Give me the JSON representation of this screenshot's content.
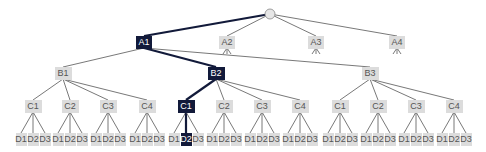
{
  "diagram": {
    "type": "tree",
    "colors": {
      "node_fill": "#dcdcdc",
      "node_text": "#555555",
      "active_fill": "#121a3a",
      "active_text": "#ffffff",
      "edge": "#555555",
      "active_edge": "#121a3a",
      "root_fill": "#e6e6e6"
    },
    "root": {
      "label": "",
      "x": 270,
      "y": 14
    },
    "level_a": [
      {
        "label": "A1",
        "x": 144,
        "y": 42,
        "active": true
      },
      {
        "label": "A2",
        "x": 227,
        "y": 42,
        "active": false
      },
      {
        "label": "A3",
        "x": 316,
        "y": 42,
        "active": false
      },
      {
        "label": "A4",
        "x": 397,
        "y": 42,
        "active": false
      }
    ],
    "level_b": [
      {
        "label": "B1",
        "x": 63,
        "y": 73,
        "active": false
      },
      {
        "label": "B2",
        "x": 216,
        "y": 73,
        "active": true
      },
      {
        "label": "B3",
        "x": 370,
        "y": 73,
        "active": false
      }
    ],
    "level_c": [
      {
        "label": "C1",
        "x": 33,
        "y": 106,
        "parent": 0,
        "active": false
      },
      {
        "label": "C2",
        "x": 70,
        "y": 106,
        "parent": 0,
        "active": false
      },
      {
        "label": "C3",
        "x": 108,
        "y": 106,
        "parent": 0,
        "active": false
      },
      {
        "label": "C4",
        "x": 147,
        "y": 106,
        "parent": 0,
        "active": false
      },
      {
        "label": "C1",
        "x": 186,
        "y": 106,
        "parent": 1,
        "active": true
      },
      {
        "label": "C2",
        "x": 224,
        "y": 106,
        "parent": 1,
        "active": false
      },
      {
        "label": "C3",
        "x": 262,
        "y": 106,
        "parent": 1,
        "active": false
      },
      {
        "label": "C4",
        "x": 300,
        "y": 106,
        "parent": 1,
        "active": false
      },
      {
        "label": "C1",
        "x": 340,
        "y": 106,
        "parent": 2,
        "active": false
      },
      {
        "label": "C2",
        "x": 378,
        "y": 106,
        "parent": 2,
        "active": false
      },
      {
        "label": "C3",
        "x": 416,
        "y": 106,
        "parent": 2,
        "active": false
      },
      {
        "label": "C4",
        "x": 454,
        "y": 106,
        "parent": 2,
        "active": false
      }
    ],
    "level_d_labels": [
      "D1",
      "D2",
      "D3"
    ],
    "level_d_y": 139,
    "level_d_spacing": 12,
    "active_d": {
      "c_index": 4,
      "d_index": 1
    },
    "stub_children_of": [
      "A2",
      "A3",
      "A4"
    ]
  }
}
